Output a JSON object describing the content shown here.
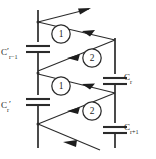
{
  "diagram": {
    "stroke_color": "#2b2b2b",
    "background_color": "#ffffff",
    "capacitors": [
      {
        "name": "c-r-minus-1",
        "base": "C",
        "subscript": "r−1",
        "prime": "′",
        "rail": "left",
        "label_text": "C′r−1"
      },
      {
        "name": "c-r-prime",
        "base": "C",
        "subscript": "r",
        "prime": "′",
        "rail": "left",
        "label_text": "C′r"
      },
      {
        "name": "c-r",
        "base": "C",
        "subscript": "r",
        "prime": "",
        "rail": "right",
        "label_text": "Cr"
      },
      {
        "name": "c-r-plus-1",
        "base": "C",
        "subscript": "r+1",
        "prime": "",
        "rail": "right",
        "label_text": "Cr+1"
      }
    ],
    "switches": [
      {
        "name": "switch-phase-1-upper",
        "label": "1",
        "cx": 61,
        "cy": 34
      },
      {
        "name": "switch-phase-2-upper",
        "label": "2",
        "cx": 92,
        "cy": 58
      },
      {
        "name": "switch-phase-1-lower",
        "label": "1",
        "cx": 61,
        "cy": 86
      },
      {
        "name": "switch-phase-2-lower",
        "label": "2",
        "cx": 92,
        "cy": 111
      }
    ]
  }
}
